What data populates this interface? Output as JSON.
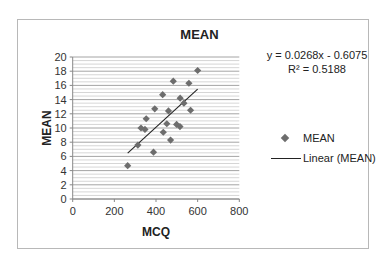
{
  "chart_data": {
    "type": "scatter",
    "title": "MEAN",
    "xlabel": "MCQ",
    "ylabel": "MEAN",
    "xlim": [
      0,
      800
    ],
    "ylim": [
      0,
      20
    ],
    "x_ticks": [
      0,
      200,
      400,
      600,
      800
    ],
    "y_ticks": [
      0,
      2,
      4,
      6,
      8,
      10,
      12,
      14,
      16,
      18,
      20
    ],
    "grid": "horizontal major and minor",
    "legend_position": "right",
    "series": [
      {
        "name": "MEAN",
        "marker": "diamond",
        "color": "#6d6d6d",
        "points": [
          {
            "x": 264,
            "y": 4.7
          },
          {
            "x": 313,
            "y": 7.6
          },
          {
            "x": 328,
            "y": 10.0
          },
          {
            "x": 347,
            "y": 9.8
          },
          {
            "x": 353,
            "y": 11.3
          },
          {
            "x": 388,
            "y": 6.6
          },
          {
            "x": 394,
            "y": 12.7
          },
          {
            "x": 432,
            "y": 14.7
          },
          {
            "x": 435,
            "y": 9.4
          },
          {
            "x": 452,
            "y": 10.6
          },
          {
            "x": 460,
            "y": 12.4
          },
          {
            "x": 470,
            "y": 8.3
          },
          {
            "x": 483,
            "y": 16.6
          },
          {
            "x": 499,
            "y": 10.5
          },
          {
            "x": 515,
            "y": 10.2
          },
          {
            "x": 516,
            "y": 14.2
          },
          {
            "x": 534,
            "y": 13.5
          },
          {
            "x": 558,
            "y": 16.3
          },
          {
            "x": 566,
            "y": 12.5
          },
          {
            "x": 600,
            "y": 18.1
          }
        ]
      }
    ],
    "trendline": {
      "name": "Linear (MEAN)",
      "slope": 0.0268,
      "intercept": -0.6075,
      "x_range": [
        264,
        600
      ],
      "color": "#222222"
    },
    "annotations": {
      "equation": "y = 0.0268x - 0.6075",
      "r_squared": "R² = 0.5188"
    }
  },
  "labels": {
    "title": "MEAN",
    "xlabel": "MCQ",
    "ylabel": "MEAN",
    "equation": "y = 0.0268x - 0.6075",
    "r_squared": "R² = 0.5188",
    "legend_series": "MEAN",
    "legend_trend": "Linear (MEAN)"
  }
}
